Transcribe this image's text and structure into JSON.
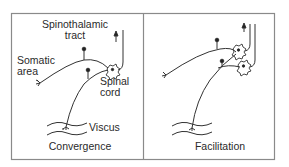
{
  "figure": {
    "panels": [
      {
        "id": "convergence",
        "caption": "Convergence",
        "labels": {
          "tract_line1": "Spinothalamic",
          "tract_line2": "tract",
          "somatic_line1": "Somatic",
          "somatic_line2": "area",
          "cord_line1": "Spinal",
          "cord_line2": "cord",
          "viscus": "Viscus"
        }
      },
      {
        "id": "facilitation",
        "caption": "Facilitation"
      }
    ],
    "colors": {
      "line": "#333333",
      "frame": "#8a8a8a",
      "text": "#2a2a2a"
    }
  }
}
